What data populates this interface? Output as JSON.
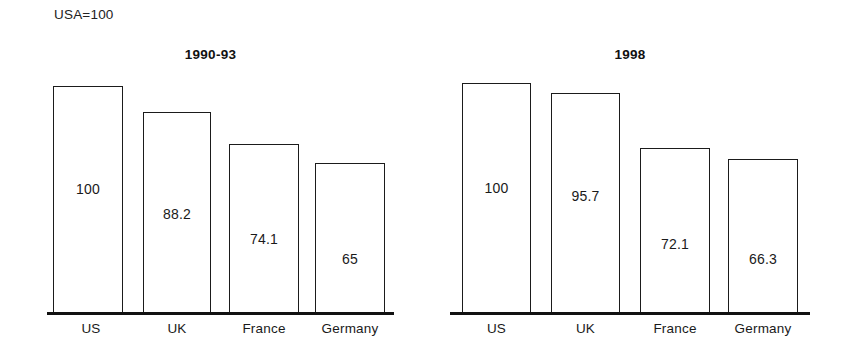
{
  "note": "USA=100",
  "chart_data": [
    {
      "type": "bar",
      "title": "1990-93",
      "categories": [
        "US",
        "UK",
        "France",
        "Germany"
      ],
      "values": [
        100,
        88.2,
        74.1,
        65
      ],
      "value_labels": [
        "100",
        "88.2",
        "74.1",
        "65"
      ],
      "xlabel": "",
      "ylabel": "",
      "ylim": [
        0,
        110
      ],
      "grid": false,
      "legend": "none",
      "note": "USA=100"
    },
    {
      "type": "bar",
      "title": "1998",
      "categories": [
        "US",
        "UK",
        "France",
        "Germany"
      ],
      "values": [
        100,
        95.7,
        72.1,
        66.3
      ],
      "value_labels": [
        "100",
        "95.7",
        "72.1",
        "66.3"
      ],
      "xlabel": "",
      "ylabel": "",
      "ylim": [
        0,
        110
      ],
      "grid": false,
      "legend": "none",
      "note": "USA=100"
    }
  ],
  "style": {
    "bar_fill": "#ffffff",
    "bar_stroke": "#1b1b1b",
    "axis_color": "#111111",
    "text_color": "#1a1a1a",
    "background": "#ffffff"
  },
  "geometry": {
    "left": {
      "bars": [
        {
          "x": 6,
          "w": 70,
          "top": 26,
          "label_top": 120
        },
        {
          "x": 96,
          "w": 68,
          "top": 52,
          "label_top": 145
        },
        {
          "x": 182,
          "w": 70,
          "top": 84,
          "label_top": 170
        },
        {
          "x": 268,
          "w": 70,
          "top": 103,
          "label_top": 190
        }
      ],
      "cats": [
        {
          "x": 54,
          "w": 74
        },
        {
          "x": 143,
          "w": 68
        },
        {
          "x": 229,
          "w": 70
        },
        {
          "x": 315,
          "w": 70
        }
      ]
    },
    "right": {
      "bars": [
        {
          "x": 12,
          "w": 69,
          "top": 23,
          "label_top": 119
        },
        {
          "x": 101,
          "w": 69,
          "top": 33,
          "label_top": 127
        },
        {
          "x": 190,
          "w": 70,
          "top": 88,
          "label_top": 175
        },
        {
          "x": 278,
          "w": 70,
          "top": 99,
          "label_top": 190
        }
      ],
      "cats": [
        {
          "x": 462,
          "w": 69
        },
        {
          "x": 551,
          "w": 69
        },
        {
          "x": 640,
          "w": 70
        },
        {
          "x": 728,
          "w": 70
        }
      ]
    }
  }
}
